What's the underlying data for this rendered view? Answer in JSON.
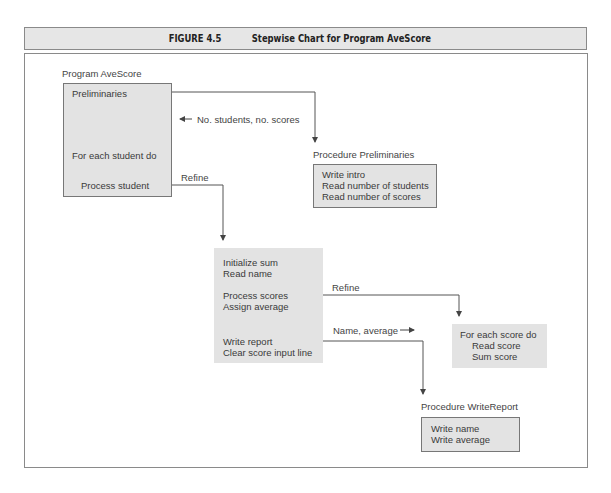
{
  "figure": {
    "number": "FIGURE 4.5",
    "title": "Stepwise Chart for Program AveScore"
  },
  "program_box": {
    "label": "Program AveScore",
    "lines": [
      "Preliminaries",
      "For each student do",
      "Process student"
    ]
  },
  "annotations": {
    "no_students": "No. students, no. scores",
    "refine_1": "Refine",
    "refine_2": "Refine",
    "name_average": "Name, average"
  },
  "preliminaries_box": {
    "label": "Procedure Preliminaries",
    "lines": [
      "Write intro",
      "Read number of students",
      "Read number of scores"
    ]
  },
  "process_student_box": {
    "lines": [
      "Initialize sum",
      "Read name",
      "Process scores",
      "Assign average",
      "Write report",
      "Clear score input line"
    ]
  },
  "process_scores_box": {
    "lines": [
      "For each score do",
      "Read score",
      "Sum score"
    ]
  },
  "writereport_box": {
    "label": "Procedure WriteReport",
    "lines": [
      "Write name",
      "Write average"
    ]
  },
  "colors": {
    "box_fill": "#e3e3e3",
    "line": "#555555",
    "title_fill": "#e6e6e6"
  }
}
